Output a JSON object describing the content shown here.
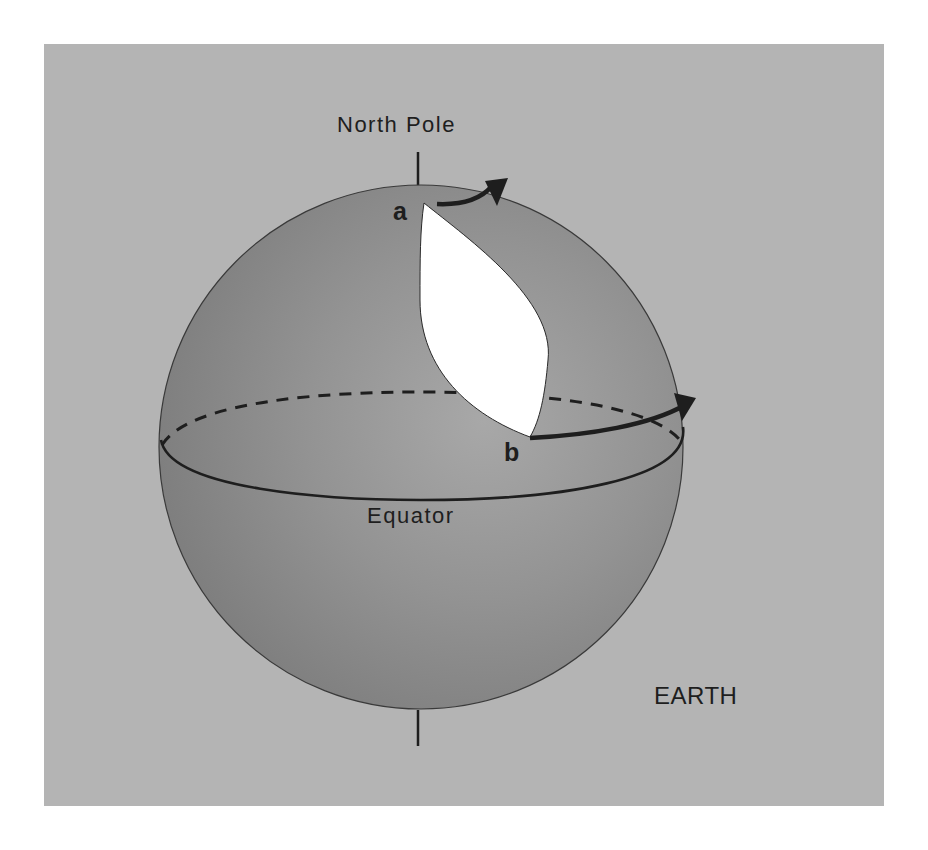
{
  "diagram": {
    "labels": {
      "north_pole": "North Pole",
      "point_a": "a",
      "point_b": "b",
      "equator": "Equator",
      "earth": "EARTH"
    },
    "colors": {
      "background": "#b4b4b4",
      "sphere_dark": "#7f7f7f",
      "sphere_light": "#a4a4a4",
      "cutout": "#ffffff",
      "lines": "#1e1e1e"
    },
    "elements": {
      "sphere": "earth-sphere",
      "axis": "rotation-axis",
      "equator_front": "solid-equator-arc",
      "equator_back": "dashed-equator-arc",
      "arrow_a": "rotation-arrow-at-a",
      "arrow_b": "rotation-arrow-at-b",
      "cutout": "lens-shaped-cutout-between-a-and-b"
    }
  }
}
